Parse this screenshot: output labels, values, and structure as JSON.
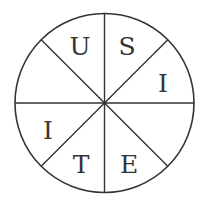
{
  "diagram": {
    "type": "segmented-circle",
    "segments": 8,
    "colors": {
      "stroke": "#333333",
      "background": "#ffffff",
      "text": "#333333"
    },
    "letters": [
      {
        "position": "top-left-upper",
        "text": "U",
        "x": 80,
        "y": 55
      },
      {
        "position": "top-right-upper",
        "text": "S",
        "x": 127,
        "y": 55
      },
      {
        "position": "right-upper",
        "text": "I",
        "x": 163,
        "y": 92
      },
      {
        "position": "left-lower",
        "text": "I",
        "x": 48,
        "y": 139
      },
      {
        "position": "bottom-left",
        "text": "T",
        "x": 81,
        "y": 173
      },
      {
        "position": "bottom-right",
        "text": "E",
        "x": 129,
        "y": 173
      }
    ],
    "empty_segments": [
      "left-upper",
      "right-lower"
    ]
  }
}
